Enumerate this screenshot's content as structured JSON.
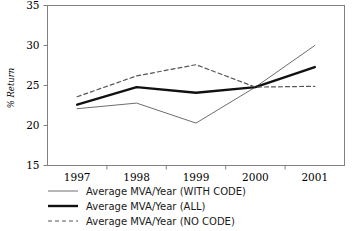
{
  "chart_data": {
    "type": "line",
    "title": "",
    "xlabel": "",
    "ylabel": "% Return",
    "categories": [
      "1997",
      "1998",
      "1999",
      "2000",
      "2001"
    ],
    "ylim": [
      15,
      35
    ],
    "yticks": [
      15,
      20,
      25,
      30,
      35
    ],
    "ytick_labels": [
      "15",
      "20",
      "25",
      "30",
      "35"
    ],
    "grid": false,
    "legend_position": "below",
    "series": [
      {
        "name": "Average MVA/Year (WITH CODE)",
        "style": "thin-solid",
        "color": "#6e6e6e",
        "width": 1,
        "dash": "none",
        "values": [
          22.1,
          22.8,
          20.3,
          24.8,
          30.0
        ]
      },
      {
        "name": "Average MVA/Year (ALL)",
        "style": "thick-solid",
        "color": "#111111",
        "width": 2.4,
        "dash": "none",
        "values": [
          22.6,
          24.8,
          24.1,
          24.8,
          27.3
        ]
      },
      {
        "name": "Average MVA/Year (NO CODE)",
        "style": "dashed",
        "color": "#555555",
        "width": 1.2,
        "dash": "4,3",
        "values": [
          23.6,
          26.2,
          27.6,
          24.8,
          24.9
        ]
      }
    ]
  },
  "legend": {
    "items": [
      {
        "label": "Average MVA/Year (WITH CODE)"
      },
      {
        "label": "Average MVA/Year (ALL)"
      },
      {
        "label": "Average MVA/Year (NO CODE)"
      }
    ]
  },
  "axes": {
    "y_title": "% Return",
    "y_labels": [
      "35",
      "30",
      "25",
      "20",
      "15"
    ],
    "x_labels": [
      "1997",
      "1998",
      "1999",
      "2000",
      "2001"
    ]
  },
  "colors": {
    "frame": "#808080",
    "axis_text": "#000000",
    "series_thin": "#6e6e6e",
    "series_thick": "#111111",
    "series_dashed": "#555555",
    "background": "#ffffff"
  }
}
